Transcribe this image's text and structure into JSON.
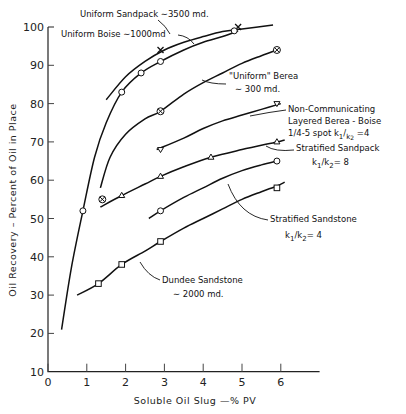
{
  "chart_data": {
    "type": "line",
    "title": "",
    "xlabel": "Soluble Oil Slug –% PV",
    "ylabel": "Oil Recovery – Percent of Oil in Place",
    "xlim": [
      0,
      7
    ],
    "ylim": [
      10,
      100
    ],
    "x_ticks": [
      0,
      1,
      2,
      3,
      4,
      5,
      6
    ],
    "y_ticks": [
      10,
      20,
      30,
      40,
      50,
      60,
      70,
      80,
      90,
      100
    ],
    "grid": false,
    "legend": "inline annotations",
    "series": [
      {
        "name": "Uniform Sandpack ~3500 md.",
        "marker": "x",
        "x": [
          2.9,
          4.9
        ],
        "y": [
          94,
          100
        ],
        "curve_x": [
          1.5,
          2.0,
          2.5,
          3.0,
          3.5,
          4.0,
          4.5,
          5.0,
          5.8
        ],
        "curve_y": [
          81,
          87,
          91,
          94,
          96,
          97.5,
          98.8,
          99.5,
          100.5
        ]
      },
      {
        "name": "Uniform Boise ~1000md",
        "marker": "o",
        "x": [
          0.9,
          1.9,
          2.4,
          2.9,
          4.8
        ],
        "y": [
          52,
          83,
          88,
          91,
          99
        ],
        "curve_x": [
          0.35,
          0.6,
          0.9,
          1.2,
          1.5,
          1.9,
          2.4,
          2.9,
          3.5,
          4.0,
          4.5,
          4.9
        ],
        "curve_y": [
          21,
          37,
          52,
          66,
          75,
          83,
          88,
          91,
          94,
          96,
          97.5,
          99
        ]
      },
      {
        "name": "\"Uniform\" Berea ~300 md.",
        "marker": "circle-x",
        "x": [
          1.4,
          2.9,
          5.9
        ],
        "y": [
          55,
          78,
          94
        ],
        "curve_x": [
          1.35,
          1.6,
          2.0,
          2.5,
          2.9,
          3.5,
          4.0,
          4.5,
          5.0,
          5.5,
          5.9
        ],
        "curve_y": [
          58,
          66,
          72,
          76,
          78,
          82.5,
          85.5,
          88,
          90.5,
          92.5,
          94
        ]
      },
      {
        "name": "Non-Communicating Layered Berea-Boise 1/4-5 spot k1/k2=4",
        "marker": "inverted-triangle",
        "x": [
          2.9,
          5.9
        ],
        "y": [
          68,
          80
        ],
        "curve_x": [
          2.8,
          3.5,
          4.0,
          4.5,
          5.0,
          5.5,
          6.0
        ],
        "curve_y": [
          68,
          71,
          73.5,
          75.5,
          77,
          78.5,
          80
        ]
      },
      {
        "name": "Stratified Sandpack k1/k2=8",
        "marker": "triangle",
        "x": [
          1.9,
          2.9,
          4.2,
          5.9
        ],
        "y": [
          56,
          61,
          66,
          70
        ],
        "curve_x": [
          1.35,
          1.9,
          2.5,
          2.9,
          3.5,
          4.2,
          5.0,
          5.9,
          6.1
        ],
        "curve_y": [
          53,
          56,
          59,
          61,
          63.5,
          66,
          68,
          70,
          70.5
        ]
      },
      {
        "name": "Stratified Sandstone k1/k2=4",
        "marker": "circle",
        "x": [
          2.9,
          5.9
        ],
        "y": [
          52,
          65
        ],
        "curve_x": [
          2.6,
          2.9,
          3.5,
          4.0,
          4.5,
          5.0,
          5.5,
          5.9
        ],
        "curve_y": [
          50,
          52,
          55.5,
          58,
          60.5,
          62.5,
          64,
          65
        ]
      },
      {
        "name": "Dundee Sandstone ~2000 md.",
        "marker": "square",
        "x": [
          1.3,
          1.9,
          2.9,
          5.9
        ],
        "y": [
          33,
          38,
          44,
          58
        ],
        "curve_x": [
          0.75,
          1.3,
          1.9,
          2.5,
          2.9,
          3.5,
          4.0,
          4.5,
          5.0,
          5.5,
          5.9,
          6.1
        ],
        "curve_y": [
          30,
          33,
          38,
          41.5,
          44,
          47.5,
          50,
          52.5,
          55,
          57,
          58.5,
          59.5
        ]
      }
    ],
    "annotations": [
      {
        "lines": [
          "Uniform Sandpack ~3500 md."
        ]
      },
      {
        "lines": [
          "Uniform Boise ~1000md"
        ]
      },
      {
        "lines": [
          "\"Uniform\" Berea",
          "~300 md."
        ]
      },
      {
        "lines": [
          "Non-Communicating",
          "Layered Berea-Boise",
          "1/4-5 spot k1/k2=4"
        ]
      },
      {
        "lines": [
          "Stratified Sandpack",
          "k1/k2 = 8"
        ]
      },
      {
        "lines": [
          "Stratified Sandstone",
          "k1/k2 = 4"
        ]
      },
      {
        "lines": [
          "Dundee Sandstone",
          "~2000 md."
        ]
      }
    ]
  },
  "labels": {
    "xlabel": "Soluble  Oil  Slug —% PV",
    "ylabel": "Oil  Recovery – Percent  of  Oil  in  Place",
    "ann_sandpack": "Uniform Sandpack ∼3500 md.",
    "ann_boise": "Uniform Boise ∼1000md",
    "ann_berea_1": "\"Uniform\" Berea",
    "ann_berea_2": "∼ 300 md.",
    "ann_layered_1": "Non-Communicating",
    "ann_layered_2": "Layered  Berea - Boise",
    "ann_layered_3": "1/4-5 spot  k",
    "ann_strat_sandpack_1": "Stratified  Sandpack",
    "ann_strat_sandpack_2": "= 8",
    "ann_strat_sandstone_1": "Stratified  Sandstone",
    "ann_strat_sandstone_2": "= 4",
    "ann_dundee_1": "Dundee  Sandstone",
    "ann_dundee_2": "∼ 2000 md."
  }
}
